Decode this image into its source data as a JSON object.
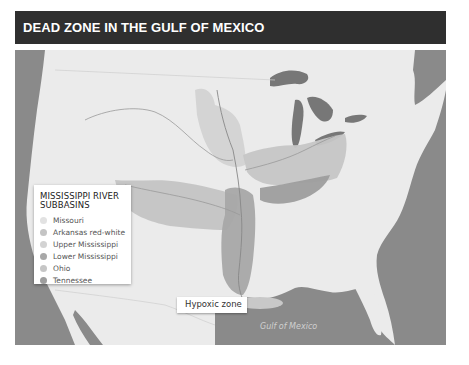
{
  "header": {
    "title": "DEAD ZONE IN THE GULF OF MEXICO"
  },
  "legend": {
    "title_line1": "MISSISSIPPI RIVER",
    "title_line2": "SUBBASINS",
    "items": [
      {
        "label": "Missouri",
        "color": "#e2e2e2"
      },
      {
        "label": "Arkansas red-white",
        "color": "#c4c4c4"
      },
      {
        "label": "Upper Mississippi",
        "color": "#d3d3d3"
      },
      {
        "label": "Lower Mississippi",
        "color": "#a8a8a8"
      },
      {
        "label": "Ohio",
        "color": "#c6c6c6"
      },
      {
        "label": "Tennessee",
        "color": "#9e9e9e"
      }
    ]
  },
  "annotations": {
    "hypoxic_zone_label": "Hypoxic zone",
    "gulf_label": "Gulf of Mexico"
  },
  "colors": {
    "title_bg": "#2f2f2f",
    "land": "#ebebeb",
    "water": "#8a8a8a",
    "hypoxic_zone": "#c8c8c8"
  }
}
